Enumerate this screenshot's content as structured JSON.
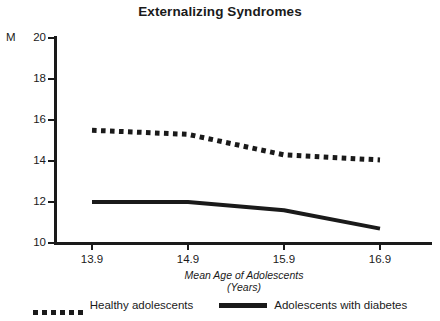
{
  "chart_data": {
    "type": "line",
    "title": "Externalizing Syndromes",
    "xlabel": "Mean Age of Adolescents",
    "xlabel_line2": "(Years)",
    "ylabel": "M",
    "x": [
      13.9,
      14.9,
      15.9,
      16.9
    ],
    "xticklabels": [
      "13.9",
      "14.9",
      "15.9",
      "16.9"
    ],
    "yticklabels": [
      "20",
      "18",
      "16",
      "14",
      "12",
      "10"
    ],
    "ylim": [
      10,
      20
    ],
    "xlim": [
      13.9,
      16.9
    ],
    "grid": false,
    "legend_position": "bottom",
    "series": [
      {
        "name": "Healthy adolescents",
        "style": "dotted",
        "color": "#1a1a1a",
        "values": [
          15.5,
          15.3,
          14.3,
          14.05
        ]
      },
      {
        "name": "Adolescents with diabetes",
        "style": "solid",
        "color": "#1a1a1a",
        "values": [
          12.0,
          12.0,
          11.6,
          10.7
        ]
      }
    ]
  },
  "legend": {
    "items": [
      {
        "label": "Healthy adolescents",
        "marker": "dotted-line-marker"
      },
      {
        "label": "Adolescents with diabetes",
        "marker": "solid-line-marker"
      }
    ]
  }
}
